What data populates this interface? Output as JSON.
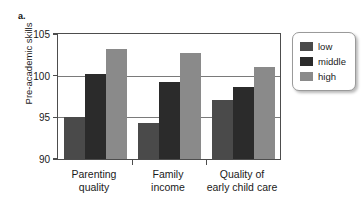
{
  "panel": {
    "label": "a."
  },
  "chart_data": {
    "type": "bar",
    "title": "",
    "xlabel": "",
    "ylabel": "Pre-academic skills",
    "ylim": [
      90,
      105
    ],
    "yticks": [
      90,
      95,
      100,
      105
    ],
    "ytick_labels": [
      "90",
      "95",
      "100",
      "105"
    ],
    "grid": true,
    "grid_axis": "y",
    "legend_position": "right",
    "categories": [
      "Parenting quality",
      "Family income",
      "Quality of early child care"
    ],
    "category_lines": [
      [
        "Parenting",
        "quality"
      ],
      [
        "Family",
        "income"
      ],
      [
        "Quality of",
        "early child care"
      ]
    ],
    "series": [
      {
        "name": "low",
        "color": "#4a4a4a",
        "values": [
          95.0,
          94.3,
          97.1
        ]
      },
      {
        "name": "middle",
        "color": "#2b2b2b",
        "values": [
          100.2,
          99.2,
          98.7
        ]
      },
      {
        "name": "high",
        "color": "#8a8a8a",
        "values": [
          103.2,
          102.7,
          101.0
        ]
      }
    ]
  },
  "legend": {
    "items": [
      {
        "label": "low",
        "color": "#4a4a4a"
      },
      {
        "label": "middle",
        "color": "#2b2b2b"
      },
      {
        "label": "high",
        "color": "#8a8a8a"
      }
    ]
  }
}
